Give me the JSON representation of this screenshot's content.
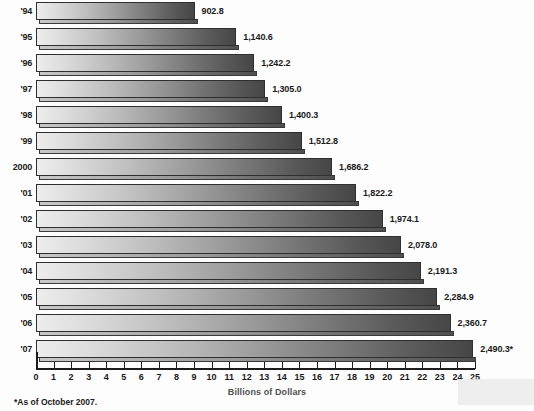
{
  "chart_data": {
    "type": "bar",
    "orientation": "horizontal",
    "title": "",
    "xlabel": "Billions of Dollars",
    "ylabel": "",
    "xlim": [
      0,
      25
    ],
    "grid": false,
    "legend": null,
    "xticks": [
      "0",
      "1",
      "2",
      "3",
      "4",
      "5",
      "6",
      "7",
      "8",
      "9",
      "10",
      "11",
      "12",
      "13",
      "14",
      "15",
      "16",
      "17",
      "18",
      "19",
      "20",
      "21",
      "22",
      "23",
      "24",
      "25"
    ],
    "categories": [
      "'94",
      "'95",
      "'96",
      "'97",
      "'98",
      "'99",
      "2000",
      "'01",
      "'02",
      "'03",
      "'04",
      "'05",
      "'06",
      "'07"
    ],
    "values": [
      902.8,
      1140.6,
      1242.2,
      1305.0,
      1400.3,
      1512.8,
      1686.2,
      1822.2,
      1974.1,
      2078.0,
      2191.3,
      2284.9,
      2360.7,
      2490.3
    ],
    "value_labels": [
      "902.8",
      "1,140.6",
      "1,242.2",
      "1,305.0",
      "1,400.3",
      "1,512.8",
      "1,686.2",
      "1,822.2",
      "1,974.1",
      "2,078.0",
      "2,191.3",
      "2,284.9",
      "2,360.7",
      "2,490.3*"
    ],
    "value_scale_note": "bar length = value / 100 on the 0-25 axis",
    "annotations": [
      "*As of October 2007."
    ]
  },
  "footnote": "*As of October 2007.",
  "axis": {
    "title": "Billions of Dollars"
  },
  "colors": {
    "bar_light": "#ededed",
    "bar_dark": "#464646",
    "bar_border": "#2f2f2f",
    "axis": "#1c1c1c",
    "text": "#1a1a1a",
    "background": "#fdfdfd"
  }
}
